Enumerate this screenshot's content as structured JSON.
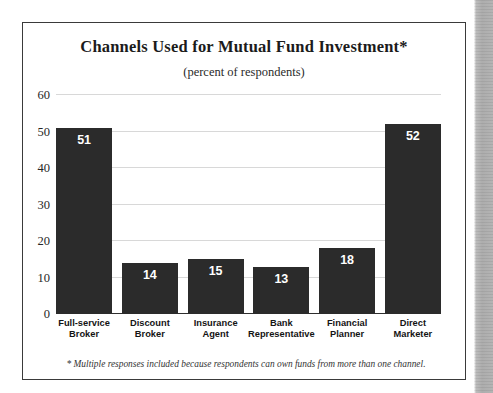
{
  "figure": {
    "title": "Channels Used for Mutual Fund Investment*",
    "subtitle": "(percent of respondents)",
    "footnote": "* Multiple responses included because respondents can own funds from more than one channel."
  },
  "chart_data": {
    "type": "bar",
    "title": "Channels Used for Mutual Fund Investment*",
    "subtitle": "(percent of respondents)",
    "xlabel": "",
    "ylabel": "",
    "ylim": [
      0,
      60
    ],
    "yticks": [
      0,
      10,
      20,
      30,
      40,
      50,
      60
    ],
    "ytick_labels": [
      "0",
      "10",
      "20",
      "30",
      "40",
      "50",
      "60"
    ],
    "grid": true,
    "legend": false,
    "bar_color": "#2b2b2b",
    "value_label_color": "#ffffff",
    "categories": [
      "Full-service Broker",
      "Discount Broker",
      "Insurance Agent",
      "Bank Representative",
      "Financial Planner",
      "Direct Marketer"
    ],
    "category_lines": [
      [
        "Full-service",
        "Broker"
      ],
      [
        "Discount",
        "Broker"
      ],
      [
        "Insurance",
        "Agent"
      ],
      [
        "Bank",
        "Representative"
      ],
      [
        "Financial",
        "Planner"
      ],
      [
        "Direct",
        "Marketer"
      ]
    ],
    "values": [
      51,
      14,
      15,
      13,
      18,
      52
    ],
    "value_labels": [
      "51",
      "14",
      "15",
      "13",
      "18",
      "52"
    ],
    "annotations": [
      "* Multiple responses included because respondents can own funds from more than one channel."
    ]
  }
}
